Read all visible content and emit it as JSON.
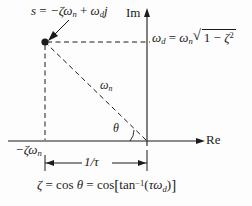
{
  "figure": {
    "background_color": "#fdfdfd",
    "line_color": "#1b1b1b",
    "axes": {
      "imaginary_label": "Im",
      "real_label": "Re"
    },
    "labels": {
      "pole_expression": {
        "s": "s",
        "equals": "=",
        "minus_zeta": "−ζω",
        "sub_n": "n",
        "plus": "+",
        "omega": "ω",
        "sub_d": "d",
        "j": "j"
      },
      "omega_d_equation": {
        "omega_d": "ω",
        "sub_d": "d",
        "equals": "=",
        "omega_n": "ω",
        "sub_n": "n",
        "sqrt_sign": "√",
        "one": "1",
        "minus": "−",
        "zeta": "ζ",
        "exponent": "2"
      },
      "omega_n": {
        "symbol": "ω",
        "sub": "n"
      },
      "theta": "θ",
      "sigma": {
        "text": "−ζω",
        "sub": "n"
      },
      "time_constant": "1/τ",
      "damping_equation": {
        "zeta": "ζ",
        "equals1": "=",
        "cos1": "cos",
        "theta": "θ",
        "equals2": "=",
        "cos2": "cos",
        "open_bracket": "[",
        "tan": "tan",
        "exponent": "−1",
        "open_paren": "(",
        "tau": "τ",
        "omega": "ω",
        "sub_d": "d",
        "close_paren": ")",
        "close_bracket": "]"
      }
    },
    "geometry": {
      "origin_x": 147,
      "origin_y": 141,
      "pole_x": 45,
      "pole_y": 42,
      "im_axis_top_y": 12,
      "re_axis_right_x": 205,
      "dimension_line_y": 163
    }
  }
}
